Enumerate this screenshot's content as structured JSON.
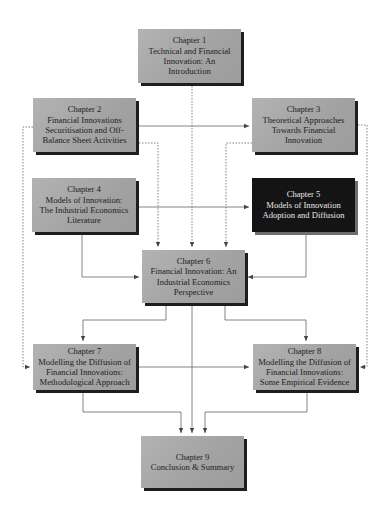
{
  "diagram": {
    "type": "chapter-structure-flowchart",
    "colors": {
      "box_fill": "#a8a8a8",
      "box_shadow": "#1e1e1e",
      "highlight_fill": "#141414",
      "highlight_text": "#e8e8e8",
      "line": "#555555"
    },
    "chapters": [
      {
        "id": "ch1",
        "heading": "Chapter 1",
        "lines": [
          "Technical and Financial",
          "Innovation: An",
          "Introduction"
        ]
      },
      {
        "id": "ch2",
        "heading": "Chapter 2",
        "lines": [
          "Financial Innovations",
          "Securitisation and Off-",
          "Balance Sheet Activities"
        ]
      },
      {
        "id": "ch3",
        "heading": "Chapter 3",
        "lines": [
          "Theoretical Approaches",
          "Towards Financial",
          "Innovation"
        ]
      },
      {
        "id": "ch4",
        "heading": "Chapter 4",
        "lines": [
          "Models of Innovation:",
          "The Industrial Economics",
          "Literature"
        ]
      },
      {
        "id": "ch5",
        "heading": "Chapter 5",
        "lines": [
          "Models of Innovation",
          "Adoption and Diffusion"
        ],
        "highlighted": true
      },
      {
        "id": "ch6",
        "heading": "Chapter 6",
        "lines": [
          "Financial Innovation: An",
          "Industrial Economics",
          "Perspective"
        ]
      },
      {
        "id": "ch7",
        "heading": "Chapter 7",
        "lines": [
          "Modelling the Diffusion of",
          "Financial Innovations:",
          "Methodological Approach"
        ]
      },
      {
        "id": "ch8",
        "heading": "Chapter 8",
        "lines": [
          "Modelling the Diffusion of",
          "Financial Innovations:",
          "Some Empirical Evidence"
        ]
      },
      {
        "id": "ch9",
        "heading": "Chapter 9",
        "lines": [
          "Conclusion & Summary"
        ]
      }
    ],
    "connections": [
      {
        "from": "ch1",
        "to": "ch6",
        "style": "dotted"
      },
      {
        "from": "ch2",
        "to": "ch3",
        "style": "solid",
        "bidirectional": true
      },
      {
        "from": "ch2",
        "to": "ch6",
        "style": "dotted"
      },
      {
        "from": "ch2",
        "to": "ch7",
        "style": "dotted"
      },
      {
        "from": "ch3",
        "to": "ch6",
        "style": "dotted"
      },
      {
        "from": "ch3",
        "to": "ch8",
        "style": "dotted"
      },
      {
        "from": "ch4",
        "to": "ch5",
        "style": "solid",
        "bidirectional": true
      },
      {
        "from": "ch4",
        "to": "ch6",
        "style": "solid"
      },
      {
        "from": "ch5",
        "to": "ch6",
        "style": "solid"
      },
      {
        "from": "ch6",
        "to": "ch7",
        "style": "solid"
      },
      {
        "from": "ch6",
        "to": "ch8",
        "style": "solid"
      },
      {
        "from": "ch6",
        "to": "ch9",
        "style": "solid"
      },
      {
        "from": "ch7",
        "to": "ch8",
        "style": "solid"
      },
      {
        "from": "ch7",
        "to": "ch9",
        "style": "solid"
      },
      {
        "from": "ch8",
        "to": "ch9",
        "style": "solid"
      }
    ]
  }
}
